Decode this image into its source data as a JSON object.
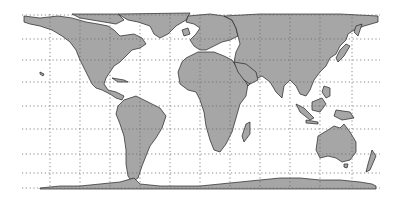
{
  "map": {
    "projection": "equal-area cylindrical (Gall-Peters style)",
    "frame": {
      "x": 22,
      "y": 14,
      "width": 358,
      "height": 174
    },
    "colors": {
      "background": "#ffffff",
      "land_fill": "#a6a6a6",
      "coastline": "#222222",
      "graticule": "#6a6a6a"
    },
    "graticule": {
      "style": "dotted",
      "meridian_x": [
        22,
        50,
        80,
        110,
        140,
        170,
        200,
        230,
        260,
        290,
        320,
        352,
        380
      ],
      "parallel_y": [
        15,
        39,
        60,
        82,
        106,
        129,
        154,
        173,
        188
      ]
    },
    "continents": [
      {
        "name": "North America"
      },
      {
        "name": "Greenland"
      },
      {
        "name": "South America"
      },
      {
        "name": "Europe"
      },
      {
        "name": "Africa"
      },
      {
        "name": "Asia"
      },
      {
        "name": "Australia"
      },
      {
        "name": "Antarctica"
      }
    ]
  }
}
